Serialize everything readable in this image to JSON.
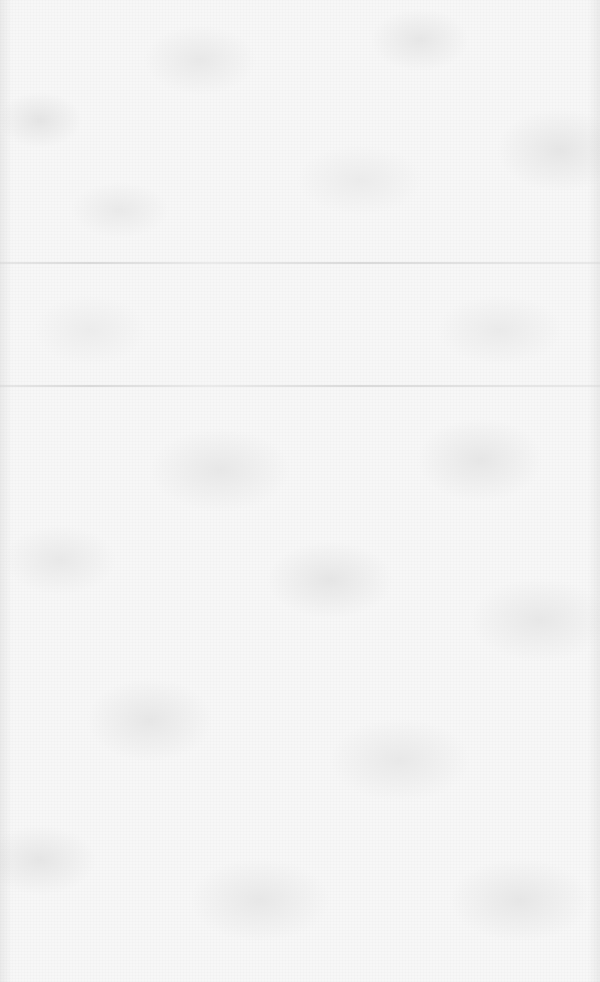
{
  "image": {
    "description": "Light gray and white digital camouflage texture with two faint horizontal fold lines",
    "pattern": "digital-camo",
    "colors": {
      "base": "#f7f7f7",
      "patch_light": "#ebebeb",
      "patch_mid": "#e5e5e5",
      "fold_line": "#d0d0d0"
    },
    "fold_lines_y": [
      262,
      385
    ]
  }
}
